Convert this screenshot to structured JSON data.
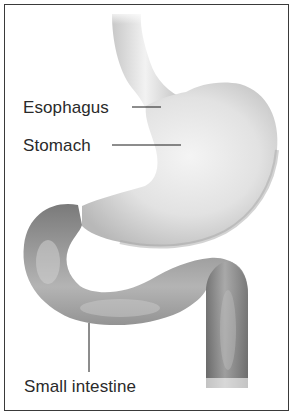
{
  "diagram": {
    "type": "anatomical-illustration",
    "labels": [
      {
        "id": "esophagus",
        "text": "Esophagus"
      },
      {
        "id": "stomach",
        "text": "Stomach"
      },
      {
        "id": "small_intestine",
        "text": "Small intestine"
      }
    ],
    "colors": {
      "frame": "#3a3a3a",
      "label_text": "#2a2a2a",
      "leader_line": "#1a1a1a",
      "esophagus_fill": "#d4d4d4",
      "stomach_fill": "#dcdcdc",
      "intestine_fill": "#8a8a8a"
    }
  }
}
